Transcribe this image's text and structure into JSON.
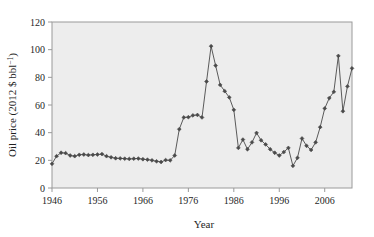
{
  "chart_data": {
    "type": "line",
    "title": "",
    "xlabel": "Year",
    "ylabel": "Oil price (2012 $ bbl",
    "ylabel_sup": "−1",
    "ylabel_tail": ")",
    "xlim": [
      1946,
      2012
    ],
    "ylim": [
      0,
      120
    ],
    "xticks": [
      1946,
      1956,
      1966,
      1976,
      1986,
      1996,
      2006
    ],
    "yticks": [
      0,
      20,
      40,
      60,
      80,
      100,
      120
    ],
    "grid": false,
    "legend": "none",
    "marker": "diamond",
    "series_color": "#4a4a4a",
    "plot_background": "#ededed",
    "frame_color": "#9a9a9a",
    "x": [
      1946,
      1947,
      1948,
      1949,
      1950,
      1951,
      1952,
      1953,
      1954,
      1955,
      1956,
      1957,
      1958,
      1959,
      1960,
      1961,
      1962,
      1963,
      1964,
      1965,
      1966,
      1967,
      1968,
      1969,
      1970,
      1971,
      1972,
      1973,
      1974,
      1975,
      1976,
      1977,
      1978,
      1979,
      1980,
      1981,
      1982,
      1983,
      1984,
      1985,
      1986,
      1987,
      1988,
      1989,
      1990,
      1991,
      1992,
      1993,
      1994,
      1995,
      1996,
      1997,
      1998,
      1999,
      2000,
      2001,
      2002,
      2003,
      2004,
      2005,
      2006,
      2007,
      2008,
      2009,
      2010,
      2011,
      2012
    ],
    "values": [
      17.5,
      23.0,
      25.5,
      25.2,
      23.5,
      23.0,
      24.0,
      24.2,
      23.8,
      24.0,
      24.2,
      24.5,
      23.0,
      22.2,
      21.5,
      21.4,
      21.2,
      21.0,
      21.2,
      21.3,
      20.8,
      20.5,
      20.0,
      19.3,
      18.8,
      20.2,
      20.0,
      23.5,
      42.5,
      51.0,
      51.2,
      52.5,
      52.8,
      51.0,
      77.0,
      102.5,
      88.5,
      74.5,
      70.0,
      65.5,
      56.5,
      29.0,
      35.0,
      28.0,
      33.0,
      39.8,
      34.5,
      31.5,
      28.0,
      25.5,
      23.5,
      26.0,
      29.0,
      16.0,
      21.8,
      35.8,
      30.5,
      27.5,
      33.0,
      44.0,
      57.5,
      65.0,
      69.5,
      95.5,
      55.5,
      73.5,
      86.5
    ]
  }
}
